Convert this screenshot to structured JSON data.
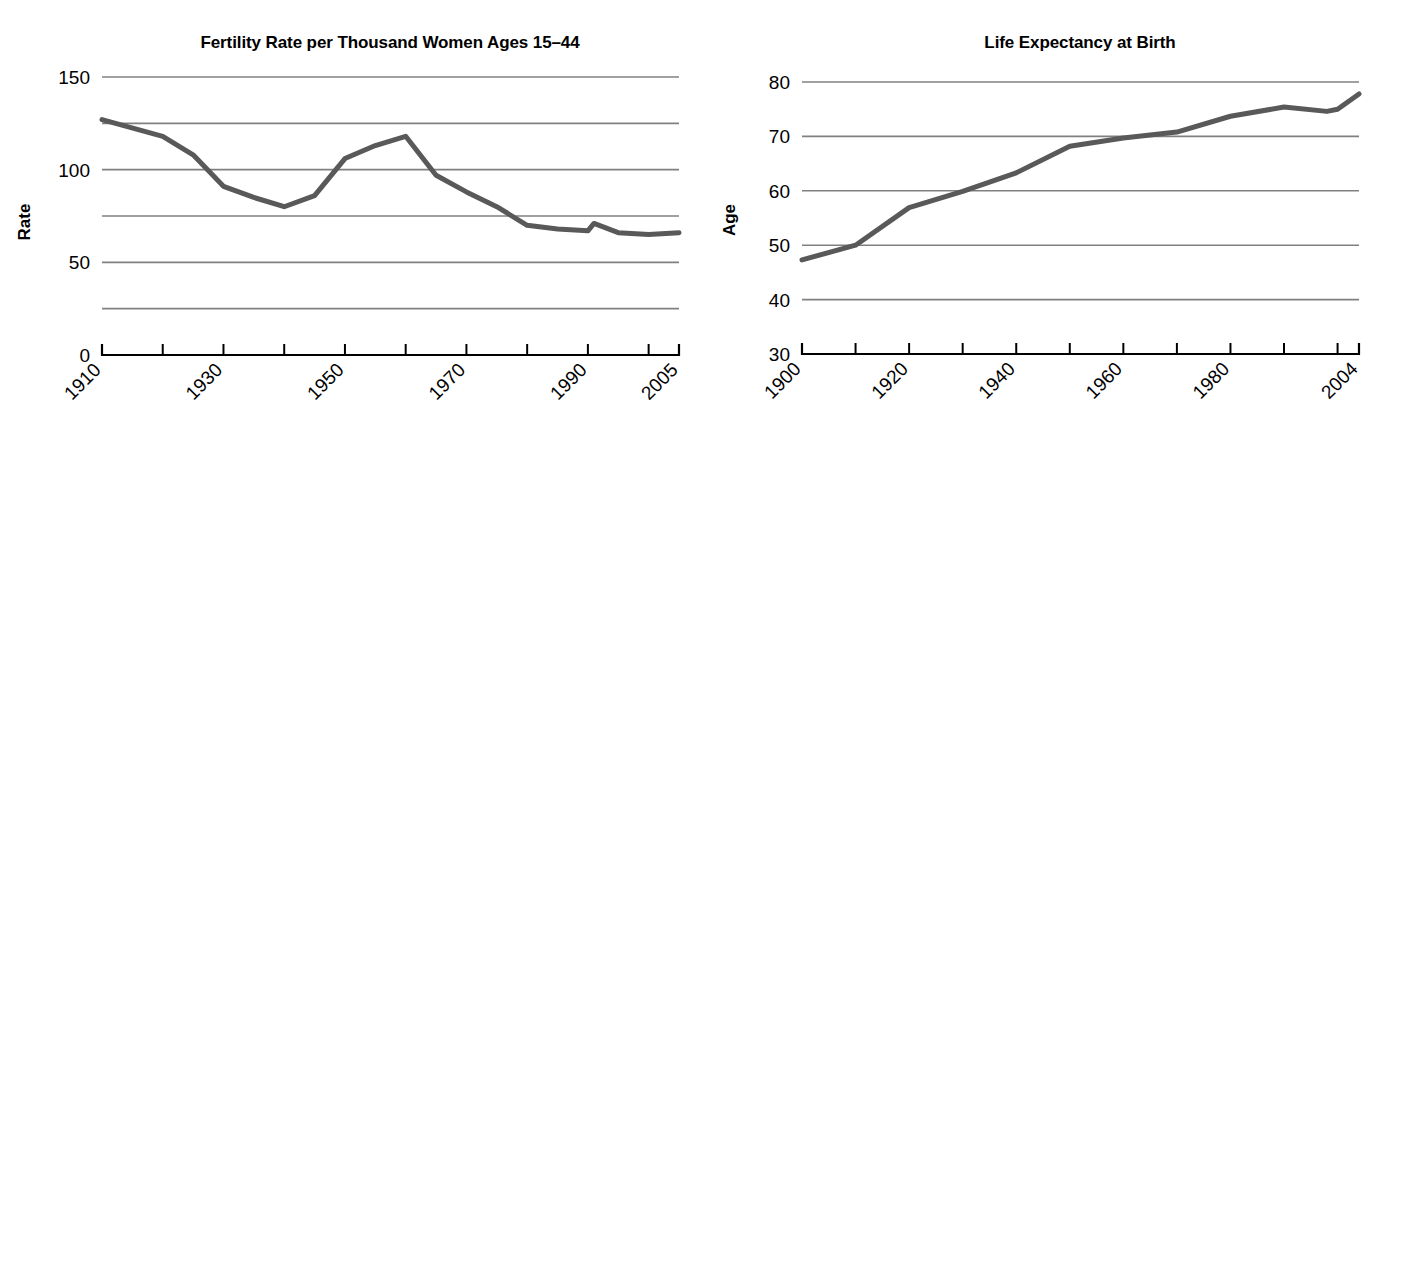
{
  "figure": {
    "panel_count": 6,
    "background": "#ffffff",
    "gridline_color": "#808080",
    "axis_color": "#000000"
  },
  "chart_data": [
    {
      "id": "fertility-rate",
      "type": "line",
      "title": "Fertility Rate per Thousand Women Ages 15–44",
      "xlabel": "",
      "ylabel": "Rate",
      "xlim": [
        1910,
        2005
      ],
      "ylim": [
        0,
        150
      ],
      "grid": true,
      "gridlines": [
        25,
        50,
        75,
        100,
        125,
        150
      ],
      "ytick_labels": [
        "0",
        "50",
        "100",
        "150"
      ],
      "ytick_values": [
        0,
        50,
        100,
        150
      ],
      "xtick_values": [
        1910,
        1920,
        1930,
        1940,
        1950,
        1960,
        1970,
        1980,
        1990,
        2000,
        2005
      ],
      "xtick_labels": [
        "1910",
        "",
        "1930",
        "",
        "1950",
        "",
        "1970",
        "",
        "1990",
        "",
        "2005"
      ],
      "legend": "none",
      "series": [
        {
          "name": "Fertility rate",
          "color": "#595959",
          "width": 5,
          "x": [
            1910,
            1920,
            1925,
            1930,
            1935,
            1940,
            1945,
            1950,
            1955,
            1960,
            1965,
            1970,
            1975,
            1980,
            1985,
            1990,
            1991,
            1995,
            2000,
            2005
          ],
          "values": [
            127,
            118,
            108,
            91,
            85,
            80,
            86,
            106,
            113,
            118,
            97,
            88,
            80,
            70,
            68,
            67,
            71,
            66,
            65,
            66
          ]
        }
      ]
    },
    {
      "id": "life-expectancy",
      "type": "line",
      "title": "Life Expectancy at Birth",
      "xlabel": "",
      "ylabel": "Age",
      "xlim": [
        1900,
        2004
      ],
      "ylim": [
        30,
        80
      ],
      "grid": true,
      "gridlines": [
        40,
        50,
        60,
        70,
        80
      ],
      "ytick_labels": [
        "30",
        "40",
        "50",
        "60",
        "70",
        "80"
      ],
      "ytick_values": [
        30,
        40,
        50,
        60,
        70,
        80
      ],
      "xtick_values": [
        1900,
        1910,
        1920,
        1930,
        1940,
        1950,
        1960,
        1970,
        1980,
        1990,
        2000,
        2004
      ],
      "xtick_labels": [
        "1900",
        "",
        "1920",
        "",
        "1940",
        "",
        "1960",
        "",
        "1980",
        "",
        "",
        "2004"
      ],
      "legend": "none",
      "series": [
        {
          "name": "Life expectancy",
          "color": "#595959",
          "width": 5,
          "x": [
            1900,
            1910,
            1920,
            1930,
            1940,
            1950,
            1960,
            1970,
            1980,
            1990,
            1998,
            2000,
            2004
          ],
          "values": [
            47.3,
            50.0,
            56.9,
            59.9,
            63.3,
            68.2,
            69.7,
            70.8,
            73.7,
            75.4,
            74.6,
            75.0,
            77.8
          ]
        }
      ]
    },
    {
      "id": "median-age-population",
      "type": "line",
      "title": "Median Age of Population (years)",
      "xlabel": "",
      "ylabel": "Age",
      "xlim": [
        1820,
        2007
      ],
      "ylim": [
        10,
        40
      ],
      "grid": true,
      "gridlines": [
        15,
        20,
        25,
        30,
        35,
        40
      ],
      "ytick_labels": [
        "10",
        "20",
        "30",
        "40"
      ],
      "ytick_values": [
        10,
        20,
        30,
        40
      ],
      "xtick_values": [
        1820,
        1830,
        1840,
        1850,
        1860,
        1870,
        1880,
        1890,
        1900,
        1910,
        1920,
        1930,
        1940,
        1950,
        1960,
        1970,
        1980,
        1990,
        2000,
        2007
      ],
      "xtick_labels": [
        "1820",
        "",
        "",
        "1850",
        "",
        "",
        "",
        "",
        "1900",
        "",
        "",
        "",
        "",
        "1950",
        "",
        "",
        "",
        "",
        "",
        "2007"
      ],
      "legend": "none",
      "series": [
        {
          "name": "Median age",
          "color": "#333333",
          "width": 5,
          "x": [
            1820,
            1830,
            1840,
            1850,
            1860,
            1870,
            1880,
            1890,
            1900,
            1910,
            1920,
            1930,
            1940,
            1950,
            1960,
            1970,
            1980,
            1990,
            2000,
            2007
          ],
          "values": [
            16.7,
            17.2,
            17.8,
            18.9,
            19.4,
            20.2,
            20.9,
            22.0,
            22.9,
            24.1,
            25.3,
            26.5,
            29.0,
            30.2,
            29.5,
            28.1,
            30.0,
            32.8,
            35.3,
            36.6
          ]
        }
      ]
    },
    {
      "id": "infant-mortality",
      "type": "line",
      "title": "Infant Mortality",
      "xlabel": "",
      "ylabel": "Per 1,000 live births",
      "xlim": [
        1920,
        2004
      ],
      "ylim": [
        0,
        150
      ],
      "grid": true,
      "gridlines": [
        30,
        60,
        90,
        120,
        150
      ],
      "ytick_labels": [
        "0",
        "30",
        "60",
        "90",
        "120",
        "150"
      ],
      "ytick_values": [
        0,
        30,
        60,
        90,
        120,
        150
      ],
      "xtick_values": [
        1920,
        1930,
        1940,
        1950,
        1960,
        1970,
        1980,
        1990,
        2000,
        2004
      ],
      "xtick_labels": [
        "1920",
        "1930",
        "",
        "1950",
        "",
        "1970",
        "",
        "1990",
        "",
        "2004"
      ],
      "legend": "inline-labels",
      "series": [
        {
          "name": "Black",
          "label": "Black",
          "color": "#6e6e6e",
          "width": 5,
          "label_x": 1936,
          "label_y": 107,
          "x": [
            1920,
            1930,
            1940,
            1950,
            1960,
            1970,
            1980,
            1990,
            2000,
            2004
          ],
          "values": [
            131,
            100,
            73,
            45,
            44,
            33,
            21,
            17,
            14,
            10
          ]
        },
        {
          "name": "Total",
          "label": "Total",
          "color": "#444444",
          "width": 5,
          "label_x": 1936,
          "label_y": 78,
          "x": [
            1920,
            1930,
            1940,
            1950,
            1960,
            1970,
            1980,
            1990,
            2000,
            2004
          ],
          "values": [
            87,
            65,
            47,
            29,
            26,
            20,
            12,
            9,
            7,
            5
          ]
        },
        {
          "name": "White",
          "label": "White",
          "color": "#1a1a1a",
          "width": 5,
          "label_x": 1936,
          "label_y": 48,
          "x": [
            1920,
            1930,
            1940,
            1950,
            1960,
            1970,
            1980,
            1990,
            2000,
            2004
          ],
          "values": [
            82,
            60,
            43,
            27,
            22,
            18,
            11,
            8,
            6,
            4
          ]
        }
      ]
    },
    {
      "id": "household-size",
      "type": "line",
      "title": "Household Size",
      "xlabel": "",
      "ylabel": "Average number of household members",
      "xlim": [
        1790,
        2006
      ],
      "ylim": [
        0,
        6
      ],
      "grid": true,
      "gridlines": [
        1,
        2,
        3,
        4,
        5,
        6
      ],
      "ytick_labels": [
        "0",
        "1",
        "2",
        "3",
        "4",
        "5",
        "6"
      ],
      "ytick_values": [
        0,
        1,
        2,
        3,
        4,
        5,
        6
      ],
      "axis_break": true,
      "xtick_values": [
        1850,
        1860,
        1870,
        1880,
        1890,
        1900,
        1910,
        1920,
        1930,
        1940,
        1950,
        1960,
        1970,
        1980,
        1990,
        2000,
        2006
      ],
      "xtick_labels": [
        "1850",
        "",
        "1870",
        "",
        "1890",
        "",
        "1910",
        "",
        "1930",
        "",
        "1950",
        "",
        "1970",
        "",
        "1990",
        "",
        "2006"
      ],
      "xtick_first_label": "1790",
      "legend": "none",
      "series": [
        {
          "name": "Household size",
          "color": "#8a8a8a",
          "width": 5,
          "x": [
            1790,
            1850,
            1860,
            1870,
            1880,
            1890,
            1900,
            1910,
            1920,
            1930,
            1940,
            1950,
            1960,
            1970,
            1980,
            1985,
            1990,
            1995,
            2000,
            2006
          ],
          "values": [
            5.79,
            5.05,
            5.0,
            4.95,
            4.8,
            4.6,
            4.45,
            4.25,
            4.07,
            3.7,
            3.35,
            3.33,
            3.25,
            3.07,
            2.75,
            2.67,
            2.62,
            2.65,
            2.58,
            2.6
          ]
        }
      ]
    },
    {
      "id": "median-age-first-marriage",
      "type": "line",
      "title": "Median Age at First Marriage",
      "xlabel": "",
      "ylabel": "Age",
      "xlim": [
        1890,
        2006
      ],
      "ylim": [
        20,
        30
      ],
      "grid": true,
      "gridlines": [
        22,
        24,
        26,
        28,
        30
      ],
      "ytick_labels": [
        "20",
        "22",
        "24",
        "26",
        "28",
        "30"
      ],
      "ytick_values": [
        20,
        22,
        24,
        26,
        28,
        30
      ],
      "xtick_values": [
        1890,
        1900,
        1910,
        1920,
        1930,
        1940,
        1950,
        1960,
        1970,
        1980,
        1990,
        2000,
        2006
      ],
      "xtick_labels": [
        "1890",
        "",
        "1910",
        "",
        "1930",
        "",
        "1950",
        "",
        "1970",
        "",
        "1990",
        "",
        "2006"
      ],
      "legend": "inline-labels",
      "series": [
        {
          "name": "Male",
          "label": "Male",
          "color": "#6e6e6e",
          "width": 5,
          "label_x": 1935,
          "label_y": 25.3,
          "x": [
            1890,
            1900,
            1910,
            1920,
            1930,
            1940,
            1950,
            1960,
            1970,
            1980,
            1990,
            2000,
            2006
          ],
          "values": [
            26.1,
            25.9,
            25.1,
            24.6,
            24.3,
            24.3,
            22.8,
            22.8,
            22.5,
            24.7,
            26.1,
            26.8,
            27.1
          ]
        },
        {
          "name": "Female",
          "label": "Female",
          "color": "#000000",
          "width": 5,
          "label_x": 1952,
          "label_y": 21.1,
          "x": [
            1890,
            1900,
            1910,
            1920,
            1930,
            1940,
            1950,
            1960,
            1970,
            1980,
            1990,
            2000,
            2006
          ],
          "values": [
            22.0,
            21.9,
            21.6,
            21.2,
            21.3,
            21.5,
            20.3,
            20.3,
            20.8,
            22.0,
            23.9,
            25.1,
            25.3
          ]
        }
      ]
    }
  ]
}
